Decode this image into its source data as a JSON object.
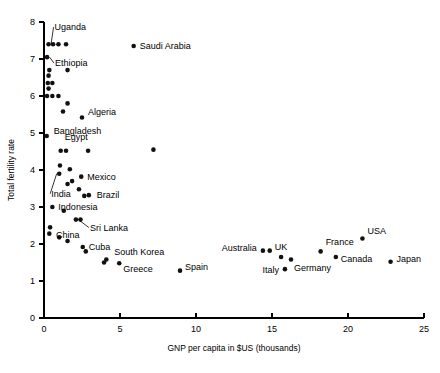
{
  "chart_data": {
    "type": "scatter",
    "title": "",
    "subtitle": "",
    "xlabel": "GNP per capita in $US (thousands)",
    "ylabel": "Total fertility rate",
    "xlim": [
      0,
      25
    ],
    "ylim": [
      0,
      8
    ],
    "xticks": [
      "0",
      "5",
      "10",
      "15",
      "20",
      "25"
    ],
    "xtick_values": [
      0,
      5,
      10,
      15,
      20,
      25
    ],
    "yticks": [
      "0",
      "1",
      "2",
      "3",
      "4",
      "5",
      "6",
      "7",
      "8"
    ],
    "ytick_values": [
      0,
      1,
      2,
      3,
      4,
      5,
      6,
      7,
      8
    ],
    "grid": false,
    "legend": "none",
    "marker": "filled-circle",
    "marker_color": "#111111",
    "points": [
      {
        "label": "Uganda",
        "x": 0.3,
        "y": 7.4,
        "label_dx": 6,
        "label_dy": -14,
        "leader": true,
        "anchor": "start"
      },
      {
        "label": "",
        "x": 0.6,
        "y": 7.4,
        "label_dx": 0,
        "label_dy": 0,
        "leader": false,
        "anchor": "start"
      },
      {
        "label": "",
        "x": 0.95,
        "y": 7.4,
        "label_dx": 0,
        "label_dy": 0,
        "leader": false,
        "anchor": "start"
      },
      {
        "label": "",
        "x": 1.45,
        "y": 7.4,
        "label_dx": 0,
        "label_dy": 0,
        "leader": false,
        "anchor": "start"
      },
      {
        "label": "Saudi Arabia",
        "x": 5.9,
        "y": 7.35,
        "label_dx": 6,
        "label_dy": 3,
        "leader": false,
        "anchor": "start"
      },
      {
        "label": "Ethiopia",
        "x": 0.2,
        "y": 7.05,
        "label_dx": 8,
        "label_dy": 9,
        "leader": true,
        "anchor": "start"
      },
      {
        "label": "",
        "x": 0.35,
        "y": 6.7,
        "label_dx": 0,
        "label_dy": 0,
        "leader": false,
        "anchor": "start"
      },
      {
        "label": "",
        "x": 1.55,
        "y": 6.7,
        "label_dx": 0,
        "label_dy": 0,
        "leader": false,
        "anchor": "start"
      },
      {
        "label": "",
        "x": 0.3,
        "y": 6.55,
        "label_dx": 0,
        "label_dy": 0,
        "leader": false,
        "anchor": "start"
      },
      {
        "label": "",
        "x": 0.25,
        "y": 6.35,
        "label_dx": 0,
        "label_dy": 0,
        "leader": false,
        "anchor": "start"
      },
      {
        "label": "",
        "x": 0.55,
        "y": 6.35,
        "label_dx": 0,
        "label_dy": 0,
        "leader": false,
        "anchor": "start"
      },
      {
        "label": "",
        "x": 0.3,
        "y": 6.2,
        "label_dx": 0,
        "label_dy": 0,
        "leader": false,
        "anchor": "start"
      },
      {
        "label": "",
        "x": 0.2,
        "y": 6.0,
        "label_dx": 0,
        "label_dy": 0,
        "leader": false,
        "anchor": "start"
      },
      {
        "label": "",
        "x": 0.55,
        "y": 6.0,
        "label_dx": 0,
        "label_dy": 0,
        "leader": false,
        "anchor": "start"
      },
      {
        "label": "",
        "x": 0.95,
        "y": 6.0,
        "label_dx": 0,
        "label_dy": 0,
        "leader": false,
        "anchor": "start"
      },
      {
        "label": "",
        "x": 1.55,
        "y": 5.8,
        "label_dx": 0,
        "label_dy": 0,
        "leader": false,
        "anchor": "start"
      },
      {
        "label": "",
        "x": 1.25,
        "y": 5.58,
        "label_dx": 0,
        "label_dy": 0,
        "leader": false,
        "anchor": "start"
      },
      {
        "label": "Algeria",
        "x": 2.5,
        "y": 5.42,
        "label_dx": 6,
        "label_dy": -2,
        "leader": false,
        "anchor": "start"
      },
      {
        "label": "Bangladesh",
        "x": 0.18,
        "y": 4.92,
        "label_dx": 7,
        "label_dy": -2,
        "leader": false,
        "anchor": "start"
      },
      {
        "label": "Egypt",
        "x": 1.1,
        "y": 4.52,
        "label_dx": 4,
        "label_dy": -11,
        "leader": false,
        "anchor": "start"
      },
      {
        "label": "",
        "x": 1.45,
        "y": 4.52,
        "label_dx": 0,
        "label_dy": 0,
        "leader": false,
        "anchor": "start"
      },
      {
        "label": "",
        "x": 2.9,
        "y": 4.52,
        "label_dx": 0,
        "label_dy": 0,
        "leader": false,
        "anchor": "start"
      },
      {
        "label": "",
        "x": 7.2,
        "y": 4.55,
        "label_dx": 0,
        "label_dy": 0,
        "leader": false,
        "anchor": "start"
      },
      {
        "label": "",
        "x": 1.05,
        "y": 4.12,
        "label_dx": 0,
        "label_dy": 0,
        "leader": false,
        "anchor": "start"
      },
      {
        "label": "",
        "x": 1.7,
        "y": 4.02,
        "label_dx": 0,
        "label_dy": 0,
        "leader": false,
        "anchor": "start"
      },
      {
        "label": "India",
        "x": 1.0,
        "y": 3.9,
        "label_dx": -8,
        "label_dy": 23,
        "leader": true,
        "anchor": "start"
      },
      {
        "label": "Mexico",
        "x": 2.45,
        "y": 3.82,
        "label_dx": 6,
        "label_dy": 3,
        "leader": false,
        "anchor": "start"
      },
      {
        "label": "",
        "x": 1.85,
        "y": 3.7,
        "label_dx": 0,
        "label_dy": 0,
        "leader": false,
        "anchor": "start"
      },
      {
        "label": "",
        "x": 1.55,
        "y": 3.62,
        "label_dx": 0,
        "label_dy": 0,
        "leader": false,
        "anchor": "start"
      },
      {
        "label": "",
        "x": 2.3,
        "y": 3.48,
        "label_dx": 0,
        "label_dy": 0,
        "leader": false,
        "anchor": "start"
      },
      {
        "label": "Brazil",
        "x": 2.95,
        "y": 3.32,
        "label_dx": 8,
        "label_dy": 3,
        "leader": false,
        "anchor": "start"
      },
      {
        "label": "",
        "x": 2.65,
        "y": 3.3,
        "label_dx": 0,
        "label_dy": 0,
        "leader": false,
        "anchor": "start"
      },
      {
        "label": "Indonesia",
        "x": 0.55,
        "y": 3.0,
        "label_dx": 6,
        "label_dy": 3,
        "leader": false,
        "anchor": "start"
      },
      {
        "label": "",
        "x": 1.3,
        "y": 2.9,
        "label_dx": 0,
        "label_dy": 0,
        "leader": false,
        "anchor": "start"
      },
      {
        "label": "Sri Lanka",
        "x": 2.1,
        "y": 2.66,
        "label_dx": 14,
        "label_dy": 11,
        "leader": true,
        "anchor": "start"
      },
      {
        "label": "",
        "x": 2.4,
        "y": 2.66,
        "label_dx": 0,
        "label_dy": 0,
        "leader": false,
        "anchor": "start"
      },
      {
        "label": "China",
        "x": 0.4,
        "y": 2.45,
        "label_dx": 6,
        "label_dy": 11,
        "leader": false,
        "anchor": "start"
      },
      {
        "label": "",
        "x": 0.35,
        "y": 2.28,
        "label_dx": 0,
        "label_dy": 0,
        "leader": false,
        "anchor": "start"
      },
      {
        "label": "",
        "x": 1.0,
        "y": 2.18,
        "label_dx": 0,
        "label_dy": 0,
        "leader": false,
        "anchor": "start"
      },
      {
        "label": "",
        "x": 1.55,
        "y": 2.08,
        "label_dx": 0,
        "label_dy": 0,
        "leader": false,
        "anchor": "start"
      },
      {
        "label": "Cuba",
        "x": 2.55,
        "y": 1.92,
        "label_dx": 6,
        "label_dy": 3,
        "leader": false,
        "anchor": "start"
      },
      {
        "label": "",
        "x": 2.75,
        "y": 1.8,
        "label_dx": 0,
        "label_dy": 0,
        "leader": false,
        "anchor": "start"
      },
      {
        "label": "South Korea",
        "x": 4.1,
        "y": 1.58,
        "label_dx": 8,
        "label_dy": -5,
        "leader": false,
        "anchor": "start"
      },
      {
        "label": "",
        "x": 3.95,
        "y": 1.5,
        "label_dx": 0,
        "label_dy": 0,
        "leader": false,
        "anchor": "start"
      },
      {
        "label": "Greece",
        "x": 4.95,
        "y": 1.48,
        "label_dx": 4,
        "label_dy": 9,
        "leader": false,
        "anchor": "start"
      },
      {
        "label": "Spain",
        "x": 8.95,
        "y": 1.28,
        "label_dx": 5,
        "label_dy": -1,
        "leader": false,
        "anchor": "start"
      },
      {
        "label": "Australia",
        "x": 14.4,
        "y": 1.82,
        "label_dx": -6,
        "label_dy": 0,
        "leader": false,
        "anchor": "end"
      },
      {
        "label": "UK",
        "x": 14.85,
        "y": 1.82,
        "label_dx": 5,
        "label_dy": -1,
        "leader": false,
        "anchor": "start"
      },
      {
        "label": "Italy",
        "x": 15.85,
        "y": 1.32,
        "label_dx": -6,
        "label_dy": 4,
        "leader": false,
        "anchor": "end"
      },
      {
        "label": "Germany",
        "x": 16.25,
        "y": 1.58,
        "label_dx": 3,
        "label_dy": 11,
        "leader": false,
        "anchor": "start"
      },
      {
        "label": "",
        "x": 15.6,
        "y": 1.65,
        "label_dx": 0,
        "label_dy": 0,
        "leader": false,
        "anchor": "start"
      },
      {
        "label": "France",
        "x": 18.2,
        "y": 1.8,
        "label_dx": 5,
        "label_dy": -6,
        "leader": false,
        "anchor": "start"
      },
      {
        "label": "Canada",
        "x": 19.2,
        "y": 1.65,
        "label_dx": 5,
        "label_dy": 5,
        "leader": false,
        "anchor": "start"
      },
      {
        "label": "USA",
        "x": 20.95,
        "y": 2.15,
        "label_dx": 5,
        "label_dy": -4,
        "leader": false,
        "anchor": "start"
      },
      {
        "label": "Japan",
        "x": 22.8,
        "y": 1.52,
        "label_dx": 6,
        "label_dy": 0,
        "leader": false,
        "anchor": "start"
      }
    ]
  }
}
